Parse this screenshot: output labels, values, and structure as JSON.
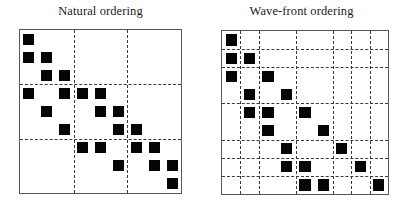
{
  "figure": {
    "panels": [
      {
        "id": "natural",
        "title": "Natural ordering",
        "matrix": {
          "size": 9,
          "frame": {
            "x": 19,
            "y": 29,
            "w": 163,
            "h": 165
          },
          "block_dividers_cols": [
            3,
            6
          ],
          "block_dividers_rows": [
            3,
            6
          ],
          "nonzeros": [
            [
              0,
              0
            ],
            [
              1,
              0
            ],
            [
              1,
              1
            ],
            [
              2,
              1
            ],
            [
              2,
              2
            ],
            [
              3,
              2
            ],
            [
              3,
              3
            ],
            [
              0,
              3
            ],
            [
              1,
              4
            ],
            [
              2,
              5
            ],
            [
              3,
              6
            ],
            [
              4,
              3
            ],
            [
              5,
              4
            ],
            [
              5,
              5
            ],
            [
              6,
              5
            ],
            [
              6,
              6
            ],
            [
              7,
              6
            ],
            [
              7,
              7
            ],
            [
              4,
              7
            ],
            [
              5,
              8
            ],
            [
              8,
              4
            ],
            [
              6,
              8
            ]
          ]
        }
      },
      {
        "id": "wavefront",
        "title": "Wave-front ordering",
        "matrix": {
          "size": 9,
          "frame": {
            "x": 221,
            "y": 30,
            "w": 168,
            "h": 165
          },
          "group_sizes": [
            1,
            2,
            2,
            2,
            1,
            1
          ],
          "nonzeros": []
        }
      }
    ]
  },
  "colors": {
    "cell": "#050505",
    "frame": "#575757",
    "divider": "#3a3a3a",
    "background": "#ffffff",
    "title": "#1b1b1b"
  },
  "chart_data": {
    "type": "heatmap",
    "xlabel": "",
    "ylabel": "",
    "panels": [
      {
        "name": "Natural ordering",
        "grid_rows": 9,
        "grid_cols": 9,
        "block_partition_cols": [
          0,
          3,
          6,
          9
        ],
        "block_partition_rows": [
          0,
          3,
          6,
          9
        ],
        "points": [
          {
            "row": 0,
            "col": 0
          },
          {
            "row": 1,
            "col": 0
          },
          {
            "row": 1,
            "col": 1
          },
          {
            "row": 2,
            "col": 1
          },
          {
            "row": 2,
            "col": 2
          },
          {
            "row": 3,
            "col": 2
          },
          {
            "row": 3,
            "col": 3
          },
          {
            "row": 3,
            "col": 0
          },
          {
            "row": 4,
            "col": 1
          },
          {
            "row": 5,
            "col": 2
          },
          {
            "row": 6,
            "col": 3
          },
          {
            "row": 3,
            "col": 4
          },
          {
            "row": 4,
            "col": 4
          },
          {
            "row": 4,
            "col": 5
          },
          {
            "row": 5,
            "col": 5
          },
          {
            "row": 5,
            "col": 6
          },
          {
            "row": 6,
            "col": 6
          },
          {
            "row": 6,
            "col": 7
          },
          {
            "row": 6,
            "col": 4
          },
          {
            "row": 7,
            "col": 5
          },
          {
            "row": 7,
            "col": 7
          },
          {
            "row": 7,
            "col": 8
          },
          {
            "row": 8,
            "col": 8
          }
        ]
      },
      {
        "name": "Wave-front ordering",
        "grid_rows": 9,
        "grid_cols": 9,
        "block_partition_cols": [
          0,
          1,
          2,
          4,
          6,
          7,
          8,
          9
        ],
        "block_partition_rows": [
          0,
          1,
          2,
          4,
          6,
          7,
          8,
          9
        ],
        "points": [
          {
            "row": 0,
            "col": 0
          },
          {
            "row": 1,
            "col": 0
          },
          {
            "row": 1,
            "col": 1
          },
          {
            "row": 2,
            "col": 0
          },
          {
            "row": 2,
            "col": 2
          },
          {
            "row": 3,
            "col": 1
          },
          {
            "row": 3,
            "col": 3
          },
          {
            "row": 4,
            "col": 1
          },
          {
            "row": 4,
            "col": 2
          },
          {
            "row": 4,
            "col": 4
          },
          {
            "row": 5,
            "col": 2
          },
          {
            "row": 5,
            "col": 5
          },
          {
            "row": 6,
            "col": 3
          },
          {
            "row": 6,
            "col": 6
          },
          {
            "row": 7,
            "col": 3
          },
          {
            "row": 7,
            "col": 4
          },
          {
            "row": 7,
            "col": 7
          },
          {
            "row": 8,
            "col": 4
          },
          {
            "row": 8,
            "col": 5
          },
          {
            "row": 8,
            "col": 8
          }
        ]
      }
    ],
    "legend": [],
    "grid": true
  }
}
